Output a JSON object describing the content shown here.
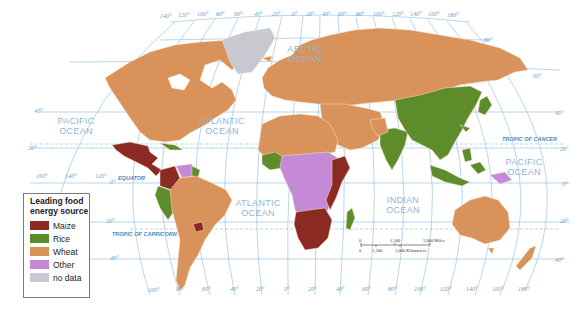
{
  "map": {
    "title": "Leading food energy source (world)",
    "colors": {
      "maize": "#8b2a22",
      "rice": "#5e8c2a",
      "wheat": "#d9925a",
      "other": "#c58ad6",
      "no_data": "#c8c8d0",
      "ocean": "#ffffff",
      "graticule": "#9cc3e4"
    },
    "ocean_labels": {
      "arctic_1": "ARCTIC",
      "arctic_2": "OCEAN",
      "pacific_west_1": "PACIFIC",
      "pacific_west_2": "OCEAN",
      "atlantic_north_1": "ATLANTIC",
      "atlantic_north_2": "OCEAN",
      "atlantic_south_1": "ATLANTIC",
      "atlantic_south_2": "OCEAN",
      "indian_1": "INDIAN",
      "indian_2": "OCEAN",
      "pacific_east_1": "PACIFIC",
      "pacific_east_2": "OCEAN"
    },
    "special_lines": {
      "equator": "EQUATOR",
      "tropic_of_cancer": "TROPIC OF CANCER",
      "tropic_of_capricorn": "TROPIC OF CAPRICORN"
    },
    "top_longitudes": [
      "140°",
      "120°",
      "100°",
      "80°",
      "60°",
      "40°",
      "20°",
      "0°",
      "20°",
      "40°",
      "60°",
      "80°",
      "100°",
      "120°",
      "140°",
      "160°",
      "180°"
    ],
    "bottom_longitudes": [
      "100°",
      "80°",
      "60°",
      "40°",
      "20°",
      "0°",
      "20°",
      "40°",
      "60°",
      "80°",
      "100°",
      "120°",
      "140°",
      "160°",
      "180°"
    ],
    "left_longitudes": [
      "160°",
      "140°",
      "120°"
    ],
    "left_latitudes": [
      "40°",
      "20°",
      "0°",
      "20°",
      "40°"
    ],
    "right_latitudes": [
      "80°",
      "60°",
      "40°",
      "20°",
      "0°",
      "20°",
      "40°"
    ]
  },
  "legend": {
    "title_line1": "Leading food",
    "title_line2": "energy source",
    "items": [
      {
        "label": "Maize",
        "color": "#8b2a22"
      },
      {
        "label": "Rice",
        "color": "#5e8c2a"
      },
      {
        "label": "Wheat",
        "color": "#d9925a"
      },
      {
        "label": "Other",
        "color": "#c58ad6"
      },
      {
        "label": "no data",
        "color": "#c8c8d0"
      }
    ]
  },
  "scale_bar": {
    "miles_0": "0",
    "miles_mid": "1,500",
    "miles_end": "3,000 Miles",
    "km_0": "0",
    "km_mid": "1,500",
    "km_end": "3,000 Kilometers"
  }
}
